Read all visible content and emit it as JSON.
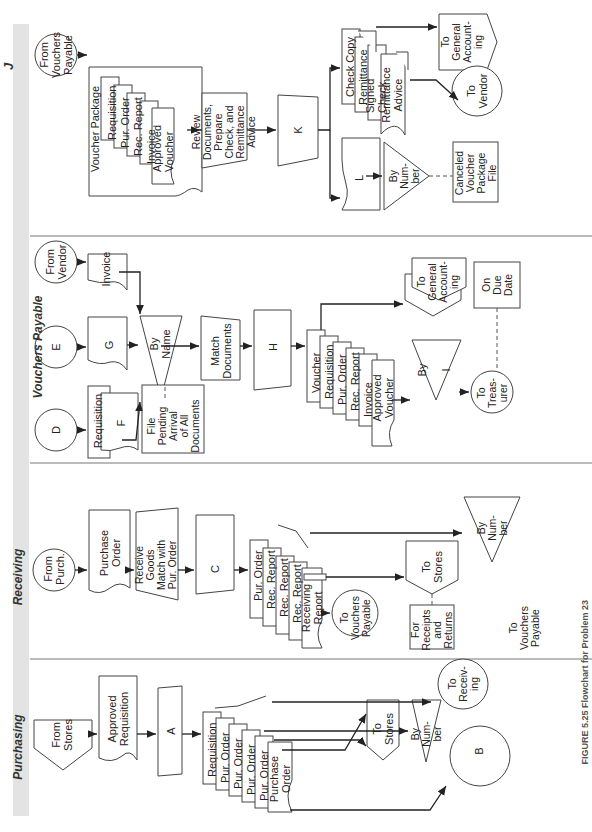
{
  "lanes": [
    {
      "id": "purchasing",
      "title": "Purchasing"
    },
    {
      "id": "receiving",
      "title": "Receiving"
    },
    {
      "id": "vouchers_payable",
      "title": "Vouchers Payable"
    },
    {
      "id": "j",
      "title": "J"
    }
  ],
  "purchasing": {
    "from_stores": "From\nStores",
    "approved_requisition": "Approved\nRequisition",
    "approved_requisition_copy": "1",
    "process_a": "A",
    "docs": [
      {
        "label": "Requisition",
        "copy": "1"
      },
      {
        "label": "Pur. Order",
        "copy": "5"
      },
      {
        "label": "Pur. Order",
        "copy": "4"
      },
      {
        "label": "Pur. Order",
        "copy": "3"
      },
      {
        "label": "Pur. Order",
        "copy": "2"
      },
      {
        "label": "Purchase\nOrder",
        "copy": "1"
      }
    ],
    "to_vouchers_payable": "To\nVouchers\nPayable",
    "to_receiving": "To\nReceiv-\ning",
    "file_by_number": "By\nNum-\nber",
    "to_stores": "To\nStores",
    "connector_b": "B"
  },
  "receiving": {
    "from_purch": "From\nPurch.",
    "purchase_order": "Purchase\nOrder",
    "purchase_order_copy": "4",
    "receive_goods": "Receive\nGoods\nMatch with\nPur. Order",
    "process_c": "C",
    "docs": [
      {
        "label": "Pur. Order",
        "copy": "4"
      },
      {
        "label": "Rec. Report",
        "copy": "4"
      },
      {
        "label": "Rec. Report",
        "copy": "3"
      },
      {
        "label": "Rec. Report",
        "copy": "2"
      },
      {
        "label": "Receiving\nReport",
        "copy": "1"
      }
    ],
    "file_by_number": "By\nNum-\nber",
    "to_stores": "To\nStores",
    "to_vouchers_payable": "To\nVouchers\nPayable",
    "annotation": "For\nReceipts\nand Returns"
  },
  "vouchers_payable": {
    "connector_d": "D",
    "connector_e": "E",
    "from_vendor": "From\nVendor",
    "doc_requisition": "Requisition",
    "doc_requisition_copy": "1",
    "doc_f": "F",
    "doc_g": "G",
    "doc_invoice": "Invoice",
    "file_by_name": "By\nName",
    "file_annotation": "File\nPending\nArrival\nof All\nDocuments",
    "match_documents": "Match\nDocuments",
    "process_h": "H",
    "docs": [
      {
        "label": "Voucher",
        "copy": "2"
      },
      {
        "label": "Requisition",
        "copy": "1"
      },
      {
        "label": "Pur. Order",
        "copy": "5"
      },
      {
        "label": "Rec. Report",
        "copy": "1"
      },
      {
        "label": "Invoice",
        "copy": ""
      },
      {
        "label": "Approved\nVoucher",
        "copy": "1"
      }
    ],
    "to_general_accounting": "To\nGeneral\nAccount-\ning",
    "file_by_i": "By\n\nI",
    "to_treasurer": "To\nTreas-\nurer",
    "on_due_date": "On\nDue\nDate"
  },
  "j": {
    "from_vouchers_payable": "From\nVouchers\nPayable",
    "voucher_package_title": "Voucher Package",
    "package_docs": [
      {
        "label": "Requisition",
        "copy": "1"
      },
      {
        "label": "Pur. Order",
        "copy": "5"
      },
      {
        "label": "Rec. Report",
        "copy": "1"
      },
      {
        "label": "Invoice",
        "copy": ""
      },
      {
        "label": "Approved\nVoucher",
        "copy": "1"
      }
    ],
    "review_documents": "Review\nDocuments,\nPrepare\nCheck, and\nRemittance\nAdvice",
    "process_k": "K",
    "check_docs": [
      {
        "label": "Check Copy",
        "copy": ""
      },
      {
        "label": "Remittance",
        "copy": "2"
      },
      {
        "label": "Signed Check",
        "copy": ""
      },
      {
        "label": "Remittance\nAdvice",
        "copy": "1"
      }
    ],
    "to_general_accounting": "To\nGeneral\nAccount-\ning",
    "to_vendor": "To\nVendor",
    "doc_l": "L",
    "file_by_number": "By\nNum-\nber",
    "canceled_file": "Canceled\nVoucher\nPackage\nFile"
  },
  "caption": "FIGURE 5.25 Flowchart for Problem 23"
}
